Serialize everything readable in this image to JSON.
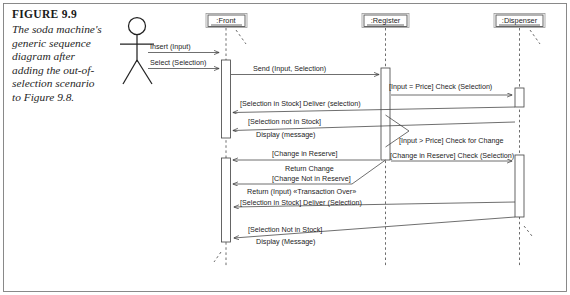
{
  "figure": {
    "label": "FIGURE 9.9",
    "caption": "The soda machine's generic sequence diagram after adding the out-of-selection scenario to Figure 9.8."
  },
  "diagram": {
    "type": "uml-sequence-diagram",
    "actor": {
      "name": "actor",
      "label": ""
    },
    "lifelines": [
      {
        "id": "front",
        "label": ":Front",
        "x": 226
      },
      {
        "id": "register",
        "label": ":Register",
        "x": 385
      },
      {
        "id": "dispenser",
        "label": ":Dispenser",
        "x": 519
      }
    ],
    "messages": [
      {
        "id": "m1",
        "label": "Insert (Input)",
        "from": "actor",
        "to": "front",
        "y": 47
      },
      {
        "id": "m2",
        "label": "Select (Selection)",
        "from": "actor",
        "to": "front",
        "y": 63
      },
      {
        "id": "m3",
        "label": "Send (Input, Selection)",
        "from": "front",
        "to": "register",
        "y": 70
      },
      {
        "id": "m4",
        "label": "[Input = Price] Check (Selection)",
        "from": "register",
        "to": "dispenser",
        "y": 90
      },
      {
        "id": "m5",
        "label": "[Selection in Stock] Deliver (selection)",
        "from": "dispenser",
        "to": "front",
        "y": 108
      },
      {
        "id": "m6",
        "label": "[Selection not in Stock]",
        "from": "dispenser",
        "to": "front",
        "y": 124
      },
      {
        "id": "m6b",
        "label": "Display (message)",
        "from": "dispenser",
        "to": "front",
        "y": 133
      },
      {
        "id": "m7",
        "label": "[Input > Price]  Check for Change",
        "from": "register",
        "to": "register",
        "y": 140
      },
      {
        "id": "m8",
        "label": "[Change in Reserve]",
        "from": "register",
        "to": "front",
        "y": 157
      },
      {
        "id": "m8b",
        "label": "[Change in Reserve] Check (Selection)",
        "from": "register",
        "to": "dispenser",
        "y": 157
      },
      {
        "id": "m9",
        "label": "Return Change",
        "from": "register",
        "to": "front",
        "y": 168
      },
      {
        "id": "m10",
        "label": "[Change Not in Reserve]",
        "from": "register",
        "to": "front",
        "y": 181
      },
      {
        "id": "m10b",
        "label": "Return (Input) «Transaction Over»",
        "from": "register",
        "to": "front",
        "y": 191
      },
      {
        "id": "m11",
        "label": "[Selection in Stock] Deliver (Selection)",
        "from": "dispenser",
        "to": "front",
        "y": 211
      },
      {
        "id": "m12",
        "label": "[Selection Not in Stock]",
        "from": "dispenser",
        "to": "front",
        "y": 233
      },
      {
        "id": "m12b",
        "label": "Display (Message)",
        "from": "dispenser",
        "to": "front",
        "y": 243
      }
    ]
  },
  "colors": {
    "line": "#4a4a4a",
    "text": "#1c1c1c",
    "frame": "#7d7d7d",
    "background": "#ffffff"
  }
}
